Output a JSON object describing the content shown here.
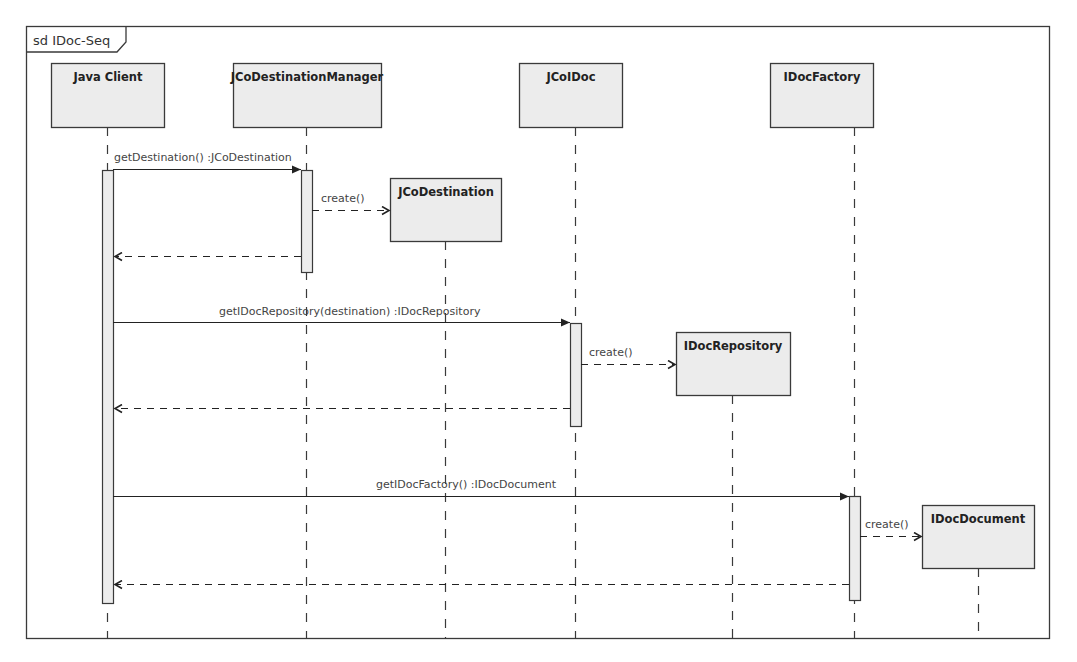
{
  "diagram": {
    "frame_label": "sd IDoc-Seq",
    "colors": {
      "box_fill": "#ececec",
      "stroke": "#3a3a3a",
      "text": "#333333",
      "background": "#ffffff"
    },
    "lifelines": [
      {
        "id": "java_client",
        "label": "Java Client"
      },
      {
        "id": "jco_destination_manager",
        "label": "JCoDestinationManager"
      },
      {
        "id": "jco_idoc",
        "label": "JCoIDoc"
      },
      {
        "id": "idoc_factory",
        "label": "IDocFactory"
      }
    ],
    "created_objects": [
      {
        "id": "jco_destination",
        "label": "JCoDestination"
      },
      {
        "id": "idoc_repository",
        "label": "IDocRepository"
      },
      {
        "id": "idoc_document",
        "label": "IDocDocument"
      }
    ],
    "messages": [
      {
        "from": "Java Client",
        "to": "JCoDestinationManager",
        "type": "sync",
        "label": "getDestination() :JCoDestination"
      },
      {
        "from": "JCoDestinationManager",
        "to": "JCoDestination",
        "type": "create",
        "label": "create()"
      },
      {
        "from": "JCoDestinationManager",
        "to": "Java Client",
        "type": "return",
        "label": ""
      },
      {
        "from": "Java Client",
        "to": "JCoIDoc",
        "type": "sync",
        "label": "getIDocRepository(destination) :IDocRepository"
      },
      {
        "from": "JCoIDoc",
        "to": "IDocRepository",
        "type": "create",
        "label": "create()"
      },
      {
        "from": "JCoIDoc",
        "to": "Java Client",
        "type": "return",
        "label": ""
      },
      {
        "from": "Java Client",
        "to": "IDocFactory",
        "type": "sync",
        "label": "getIDocFactory() :IDocDocument"
      },
      {
        "from": "IDocFactory",
        "to": "IDocDocument",
        "type": "create",
        "label": "create()"
      },
      {
        "from": "IDocFactory",
        "to": "Java Client",
        "type": "return",
        "label": ""
      }
    ]
  }
}
